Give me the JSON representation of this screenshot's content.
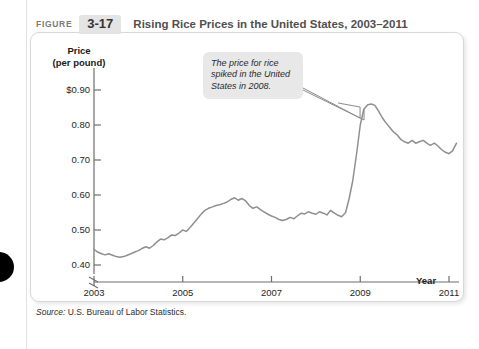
{
  "header": {
    "figure_word": "FIGURE",
    "figure_number": "3-17",
    "title": "Rising Rice Prices in the United States, 2003–2011"
  },
  "callout": {
    "text": "The price for rice spiked in the United States in 2008."
  },
  "source": {
    "label": "Source:",
    "text": " U.S. Bureau of Labor Statistics."
  },
  "colors": {
    "line": "#8f8f8f",
    "axis": "#6e6e6e",
    "callout_bg": "#e8e8e8",
    "badge_bg": "#e4e4e4",
    "title_text": "#4f4f4f",
    "panel_border": "#d8d8d8"
  },
  "chart_data": {
    "type": "line",
    "title": "Rising Rice Prices in the United States, 2003–2011",
    "xlabel": "Year",
    "ylabel": "Price (per pound)",
    "xlim": [
      2003,
      2011.25
    ],
    "ylim": [
      0.36,
      0.95
    ],
    "y_axis_break": true,
    "y_break_below": 0.4,
    "grid": false,
    "legend": "none",
    "xticks": [
      2003,
      2005,
      2007,
      2009,
      2011
    ],
    "xtick_labels": [
      "2003",
      "2005",
      "2007",
      "2009",
      "2011"
    ],
    "yticks": [
      0.4,
      0.5,
      0.6,
      0.7,
      0.8,
      0.9
    ],
    "ytick_labels": [
      "0.40",
      "0.50",
      "0.60",
      "0.70",
      "0.80",
      "$0.90"
    ],
    "annotations": [
      {
        "text": "The price for rice spiked in the United States in 2008.",
        "points_to_x": 2008.5,
        "points_to_y": 0.86
      }
    ],
    "series": [
      {
        "name": "Rice price (per pound)",
        "x": [
          2003.0,
          2003.08,
          2003.17,
          2003.25,
          2003.33,
          2003.42,
          2003.5,
          2003.58,
          2003.67,
          2003.75,
          2003.83,
          2003.92,
          2004.0,
          2004.08,
          2004.17,
          2004.25,
          2004.33,
          2004.42,
          2004.5,
          2004.58,
          2004.67,
          2004.75,
          2004.83,
          2004.92,
          2005.0,
          2005.08,
          2005.17,
          2005.25,
          2005.33,
          2005.42,
          2005.5,
          2005.58,
          2005.67,
          2005.75,
          2005.83,
          2005.92,
          2006.0,
          2006.08,
          2006.17,
          2006.25,
          2006.33,
          2006.42,
          2006.5,
          2006.58,
          2006.67,
          2006.75,
          2006.83,
          2006.92,
          2007.0,
          2007.08,
          2007.17,
          2007.25,
          2007.33,
          2007.42,
          2007.5,
          2007.58,
          2007.67,
          2007.75,
          2007.83,
          2007.92,
          2008.0,
          2008.08,
          2008.17,
          2008.25,
          2008.33,
          2008.42,
          2008.5,
          2008.58,
          2008.67,
          2008.75,
          2008.83,
          2008.92,
          2009.0,
          2009.08,
          2009.17,
          2009.25,
          2009.33,
          2009.42,
          2009.5,
          2009.58,
          2009.67,
          2009.75,
          2009.83,
          2009.92,
          2010.0,
          2010.08,
          2010.17,
          2010.25,
          2010.33,
          2010.42,
          2010.5,
          2010.58,
          2010.67,
          2010.75,
          2010.83,
          2010.92,
          2011.0,
          2011.08,
          2011.17
        ],
        "values": [
          0.445,
          0.437,
          0.432,
          0.429,
          0.432,
          0.428,
          0.424,
          0.422,
          0.424,
          0.428,
          0.432,
          0.437,
          0.441,
          0.447,
          0.452,
          0.448,
          0.455,
          0.466,
          0.474,
          0.472,
          0.478,
          0.486,
          0.484,
          0.492,
          0.5,
          0.496,
          0.508,
          0.52,
          0.532,
          0.546,
          0.556,
          0.562,
          0.566,
          0.57,
          0.572,
          0.576,
          0.58,
          0.587,
          0.592,
          0.585,
          0.59,
          0.583,
          0.57,
          0.562,
          0.566,
          0.558,
          0.552,
          0.545,
          0.54,
          0.536,
          0.53,
          0.527,
          0.53,
          0.536,
          0.532,
          0.54,
          0.548,
          0.546,
          0.552,
          0.548,
          0.545,
          0.552,
          0.548,
          0.543,
          0.556,
          0.548,
          0.542,
          0.538,
          0.55,
          0.59,
          0.64,
          0.72,
          0.8,
          0.845,
          0.858,
          0.86,
          0.856,
          0.838,
          0.82,
          0.806,
          0.792,
          0.78,
          0.772,
          0.758,
          0.752,
          0.748,
          0.756,
          0.748,
          0.752,
          0.756,
          0.748,
          0.742,
          0.748,
          0.74,
          0.73,
          0.722,
          0.718,
          0.726,
          0.748
        ]
      }
    ]
  }
}
